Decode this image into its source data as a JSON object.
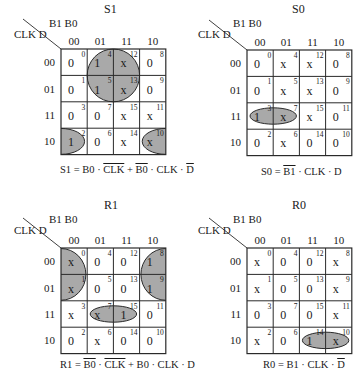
{
  "figure": {
    "row_var_label": "CLK D",
    "col_var_label": "B1 B0",
    "col_headers": [
      "00",
      "01",
      "11",
      "10"
    ],
    "row_headers": [
      "00",
      "01",
      "11",
      "10"
    ],
    "group_fill": "#a9a9a9",
    "line_color": "#2a2a2a"
  },
  "maps": [
    {
      "title": "S1",
      "cells": [
        [
          {
            "v": "0",
            "m": "0"
          },
          {
            "v": "1",
            "m": "4"
          },
          {
            "v": "x",
            "m": "12"
          },
          {
            "v": "0",
            "m": "8"
          }
        ],
        [
          {
            "v": "0",
            "m": "1"
          },
          {
            "v": "1",
            "m": "5"
          },
          {
            "v": "x",
            "m": "13"
          },
          {
            "v": "0",
            "m": "9"
          }
        ],
        [
          {
            "v": "0",
            "m": "3"
          },
          {
            "v": "0",
            "m": "7"
          },
          {
            "v": "x",
            "m": "15"
          },
          {
            "v": "x",
            "m": "11"
          }
        ],
        [
          {
            "v": "1",
            "m": "2"
          },
          {
            "v": "0",
            "m": "6"
          },
          {
            "v": "x",
            "m": "14"
          },
          {
            "v": "x",
            "m": "10"
          }
        ]
      ],
      "groups": [
        {
          "cells": [
            "4",
            "5",
            "12",
            "13"
          ],
          "term": "B0 · ¬CLK"
        },
        {
          "cells": [
            "2",
            "10"
          ],
          "term": "¬B0 · CLK · ¬D",
          "wraps": true
        }
      ],
      "equation": {
        "lhs": "S1",
        "parts": [
          {
            "t": "B0",
            "bar": false
          },
          {
            "t": " · ",
            "bar": false
          },
          {
            "t": "CLK",
            "bar": true
          },
          {
            "t": " + ",
            "bar": false
          },
          {
            "t": "B0",
            "bar": true
          },
          {
            "t": " · CLK · ",
            "bar": false
          },
          {
            "t": "D",
            "bar": true
          }
        ]
      }
    },
    {
      "title": "S0",
      "cells": [
        [
          {
            "v": "0",
            "m": "0"
          },
          {
            "v": "x",
            "m": "4"
          },
          {
            "v": "x",
            "m": "12"
          },
          {
            "v": "0",
            "m": "8"
          }
        ],
        [
          {
            "v": "0",
            "m": "1"
          },
          {
            "v": "x",
            "m": "5"
          },
          {
            "v": "x",
            "m": "13"
          },
          {
            "v": "0",
            "m": "9"
          }
        ],
        [
          {
            "v": "1",
            "m": "3"
          },
          {
            "v": "x",
            "m": "7"
          },
          {
            "v": "x",
            "m": "15"
          },
          {
            "v": "0",
            "m": "11"
          }
        ],
        [
          {
            "v": "0",
            "m": "2"
          },
          {
            "v": "x",
            "m": "6"
          },
          {
            "v": "0",
            "m": "14"
          },
          {
            "v": "0",
            "m": "10"
          }
        ]
      ],
      "groups": [
        {
          "cells": [
            "3",
            "7"
          ],
          "term": "¬B1 · CLK · D"
        }
      ],
      "equation": {
        "lhs": "S0",
        "parts": [
          {
            "t": "B1",
            "bar": true
          },
          {
            "t": " · CLK · D",
            "bar": false
          }
        ]
      }
    },
    {
      "title": "R1",
      "cells": [
        [
          {
            "v": "x",
            "m": "0"
          },
          {
            "v": "0",
            "m": "4"
          },
          {
            "v": "0",
            "m": "12"
          },
          {
            "v": "1",
            "m": "8"
          }
        ],
        [
          {
            "v": "x",
            "m": "1"
          },
          {
            "v": "0",
            "m": "5"
          },
          {
            "v": "0",
            "m": "13"
          },
          {
            "v": "1",
            "m": "9"
          }
        ],
        [
          {
            "v": "x",
            "m": "3"
          },
          {
            "v": "x",
            "m": "7"
          },
          {
            "v": "1",
            "m": "15"
          },
          {
            "v": "0",
            "m": "11"
          }
        ],
        [
          {
            "v": "0",
            "m": "2"
          },
          {
            "v": "x",
            "m": "6"
          },
          {
            "v": "0",
            "m": "14"
          },
          {
            "v": "0",
            "m": "10"
          }
        ]
      ],
      "groups": [
        {
          "cells": [
            "0",
            "1",
            "8",
            "9"
          ],
          "term": "¬B0 · ¬CLK",
          "wraps": true
        },
        {
          "cells": [
            "7",
            "15"
          ],
          "term": "B0 · CLK · D"
        }
      ],
      "equation": {
        "lhs": "R1",
        "parts": [
          {
            "t": "B0",
            "bar": true
          },
          {
            "t": " · ",
            "bar": false
          },
          {
            "t": "CLK",
            "bar": true
          },
          {
            "t": " + B0 · CLK · D",
            "bar": false
          }
        ]
      }
    },
    {
      "title": "R0",
      "cells": [
        [
          {
            "v": "x",
            "m": "0"
          },
          {
            "v": "0",
            "m": "4"
          },
          {
            "v": "0",
            "m": "12"
          },
          {
            "v": "x",
            "m": "8"
          }
        ],
        [
          {
            "v": "x",
            "m": "1"
          },
          {
            "v": "0",
            "m": "5"
          },
          {
            "v": "0",
            "m": "13"
          },
          {
            "v": "x",
            "m": "9"
          }
        ],
        [
          {
            "v": "0",
            "m": "3"
          },
          {
            "v": "0",
            "m": "7"
          },
          {
            "v": "0",
            "m": "15"
          },
          {
            "v": "x",
            "m": "11"
          }
        ],
        [
          {
            "v": "x",
            "m": "2"
          },
          {
            "v": "0",
            "m": "6"
          },
          {
            "v": "1",
            "m": "14"
          },
          {
            "v": "x",
            "m": "10"
          }
        ]
      ],
      "groups": [
        {
          "cells": [
            "14",
            "10"
          ],
          "term": "B1 · CLK · ¬D"
        }
      ],
      "equation": {
        "lhs": "R0",
        "parts": [
          {
            "t": "B1 · CLK · ",
            "bar": false
          },
          {
            "t": "D",
            "bar": true
          }
        ]
      }
    }
  ]
}
